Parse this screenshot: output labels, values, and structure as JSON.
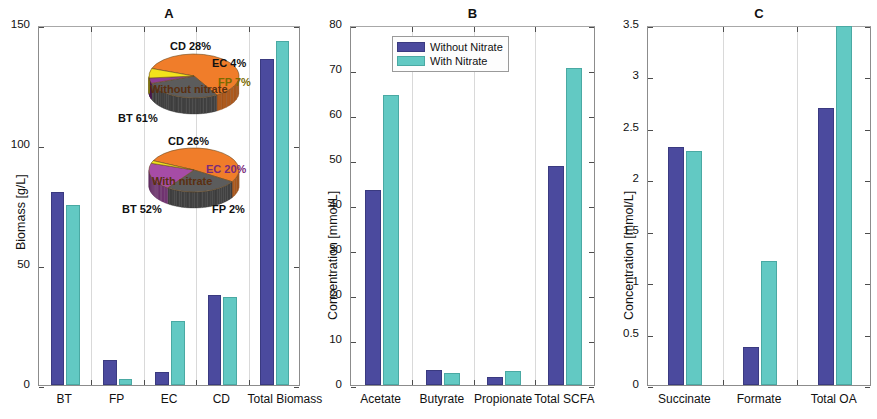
{
  "figure": {
    "panels": [
      "A",
      "B",
      "C"
    ]
  },
  "chart_data": [
    {
      "panel": "A",
      "type": "bar",
      "title": "A",
      "xlabel": "",
      "ylabel": "Biomass [g/L]",
      "ylim": [
        0,
        150
      ],
      "yticks": [
        0,
        50,
        100,
        150
      ],
      "ytick_labels": [
        "0",
        "50",
        "100",
        "150"
      ],
      "categories": [
        "BT",
        "FP",
        "EC",
        "CD",
        "Total Biomass"
      ],
      "series": [
        {
          "name": "Without Nitrate",
          "color": "#4b4a9e",
          "values": [
            80.5,
            10.5,
            5.5,
            37.5,
            136.0
          ]
        },
        {
          "name": "With Nitrate",
          "color": "#62c9c3",
          "values": [
            75.0,
            2.5,
            26.5,
            36.5,
            143.5
          ]
        }
      ],
      "grid": true,
      "legend": "none",
      "inset_pies": [
        {
          "name": "Without nitrate",
          "center_label": "Without nitrate",
          "slices": [
            {
              "label": "BT 61%",
              "key": "BT",
              "value": 61,
              "color": "#f07d2a"
            },
            {
              "label": "CD 28%",
              "key": "CD",
              "value": 28,
              "color": "#5c5c5c"
            },
            {
              "label": "EC 4%",
              "key": "EC",
              "value": 4,
              "color": "#8e3f96"
            },
            {
              "label": "FP 7%",
              "key": "FP",
              "value": 7,
              "color": "#f2e31c"
            }
          ]
        },
        {
          "name": "With nitrate",
          "center_label": "With nitrate",
          "slices": [
            {
              "label": "BT 52%",
              "key": "BT",
              "value": 52,
              "color": "#f07d2a"
            },
            {
              "label": "CD 26%",
              "key": "CD",
              "value": 26,
              "color": "#5c5c5c"
            },
            {
              "label": "EC 20%",
              "key": "EC",
              "value": 20,
              "color": "#a64ca6"
            },
            {
              "label": "FP 2%",
              "key": "FP",
              "value": 2,
              "color": "#f2e31c"
            }
          ]
        }
      ]
    },
    {
      "panel": "B",
      "type": "bar",
      "title": "B",
      "xlabel": "",
      "ylabel": "Concentration [mmol/L]",
      "ylim": [
        0,
        80
      ],
      "yticks": [
        0,
        10,
        20,
        30,
        40,
        50,
        60,
        70,
        80
      ],
      "ytick_labels": [
        "0",
        "10",
        "20",
        "30",
        "40",
        "50",
        "60",
        "70",
        "80"
      ],
      "categories": [
        "Acetate",
        "Butyrate",
        "Propionate",
        "Total SCFA"
      ],
      "series": [
        {
          "name": "Without Nitrate",
          "color": "#4b4a9e",
          "values": [
            43.4,
            3.4,
            1.7,
            48.7
          ]
        },
        {
          "name": "With Nitrate",
          "color": "#62c9c3",
          "values": [
            64.4,
            2.7,
            3.2,
            70.4
          ]
        }
      ],
      "grid": true,
      "legend": "upper-center",
      "legend_entries": [
        "Without Nitrate",
        "With Nitrate"
      ]
    },
    {
      "panel": "C",
      "type": "bar",
      "title": "C",
      "xlabel": "",
      "ylabel": "Concentration [mmol/L]",
      "ylim": [
        0,
        3.5
      ],
      "yticks": [
        0,
        0.5,
        1,
        1.5,
        2,
        2.5,
        3,
        3.5
      ],
      "ytick_labels": [
        "0",
        "0.5",
        "1",
        "1.5",
        "2",
        "2.5",
        "3",
        "3.5"
      ],
      "categories": [
        "Succinate",
        "Formate",
        "Total OA"
      ],
      "series": [
        {
          "name": "Without Nitrate",
          "color": "#4b4a9e",
          "values": [
            2.31,
            0.37,
            2.69
          ]
        },
        {
          "name": "With Nitrate",
          "color": "#62c9c3",
          "values": [
            2.28,
            1.21,
            3.49
          ]
        }
      ],
      "grid": true,
      "legend": "none"
    }
  ]
}
